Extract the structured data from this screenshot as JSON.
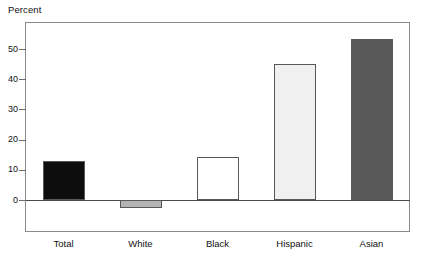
{
  "chart_data": {
    "type": "bar",
    "title": "",
    "subtitle": "",
    "ylabel": "Percent",
    "xlabel": "",
    "categories": [
      "Total",
      "White",
      "Black",
      "Hispanic",
      "Asian"
    ],
    "values": [
      12.8,
      -2.7,
      14.3,
      45.0,
      53.3
    ],
    "series": [
      {
        "name": "Percent",
        "values": [
          12.8,
          -2.7,
          14.3,
          45.0,
          53.3
        ]
      }
    ],
    "bar_colors": [
      "#0d0d0d",
      "#b3b3b3",
      "#ffffff",
      "#f0f0f0",
      "#595959"
    ],
    "bar_edge_color": "#585858",
    "ylim": [
      -5,
      58
    ],
    "yticks": [
      0,
      10,
      20,
      30,
      40,
      50
    ],
    "ytick_labels": [
      "0",
      "10",
      "20",
      "30",
      "40",
      "50"
    ],
    "grid": false,
    "legend": false,
    "legend_position": "none",
    "zero_line": true,
    "frame": true,
    "annotations": []
  },
  "axis": {
    "y_title": "Percent"
  },
  "colors": {
    "frame": "#8a8a8a",
    "zero_line": "#4a4a4a",
    "tick": "#6e6e6e",
    "text": "#111111",
    "background": "#ffffff"
  }
}
